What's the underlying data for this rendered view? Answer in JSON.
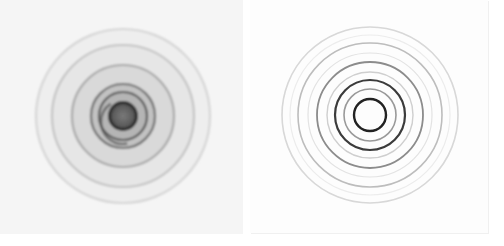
{
  "figure": {
    "panels": [
      {
        "id": "left",
        "description": "Concentric ring pattern with filled grey bands and dark central disc",
        "background": "#f5f5f5",
        "center": [
          123,
          116
        ],
        "bands": [
          {
            "r": 87,
            "fill": "#eeeeee",
            "edge": "#d6d6d6"
          },
          {
            "r": 71,
            "fill": "#e6e6e6",
            "edge": "#c4c4c4"
          },
          {
            "r": 51,
            "fill": "#d9d9d9",
            "edge": "#a8a8a8"
          },
          {
            "r": 32,
            "fill": "#c2c2c2",
            "edge": "#6e6e6e"
          },
          {
            "r": 24,
            "fill": "#b5b5b5",
            "edge": "#555555"
          }
        ],
        "disc": {
          "r": 14,
          "fill": "#6a6a6a",
          "edge": "#262626"
        }
      },
      {
        "id": "right",
        "description": "Concentric thin rings, darker toward the center",
        "background": "#fdfdfd",
        "center": [
          120,
          115
        ],
        "rings": [
          {
            "r": 88,
            "stroke": "#d8d8d8",
            "width": 1.6
          },
          {
            "r": 80,
            "stroke": "#ececec",
            "width": 1.2
          },
          {
            "r": 72,
            "stroke": "#bdbdbd",
            "width": 1.6
          },
          {
            "r": 62,
            "stroke": "#e3e3e3",
            "width": 1.2
          },
          {
            "r": 53,
            "stroke": "#8c8c8c",
            "width": 1.8
          },
          {
            "r": 43,
            "stroke": "#cfcfcf",
            "width": 1.4
          },
          {
            "r": 35,
            "stroke": "#3a3a3a",
            "width": 2.2
          },
          {
            "r": 26,
            "stroke": "#9a9a9a",
            "width": 1.6
          },
          {
            "r": 16,
            "stroke": "#202020",
            "width": 2.4
          }
        ]
      }
    ]
  }
}
